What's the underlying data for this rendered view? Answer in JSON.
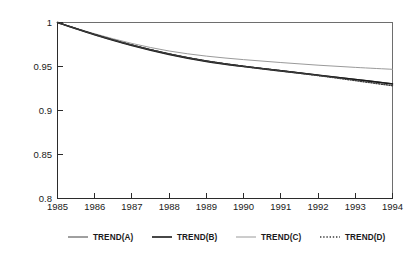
{
  "chart_data": {
    "type": "line",
    "title": "",
    "subtitle": "",
    "xlabel": "",
    "ylabel": "",
    "xlim": [
      1985,
      1994
    ],
    "ylim": [
      0.8,
      1.0
    ],
    "grid": false,
    "legend_position": "bottom",
    "x": [
      1985,
      1986,
      1987,
      1988,
      1989,
      1990,
      1991,
      1992,
      1993,
      1994
    ],
    "xtick_labels": [
      "1985",
      "1986",
      "1987",
      "1988",
      "1989",
      "1990",
      "1991",
      "1992",
      "1993",
      "1994"
    ],
    "ytick_labels": [
      "0.8",
      "0.85",
      "0.9",
      "0.95",
      "1"
    ],
    "ytick_values": [
      0.8,
      0.85,
      0.9,
      0.95,
      1.0
    ],
    "series": [
      {
        "name": "TREND(A)",
        "style": "solid-thin",
        "color": "#2b2b2b",
        "values": [
          1.0,
          0.9865,
          0.9745,
          0.9645,
          0.9565,
          0.9505,
          0.9455,
          0.9405,
          0.9355,
          0.9305
        ]
      },
      {
        "name": "TREND(B)",
        "style": "solid-thick",
        "color": "#1a1a1a",
        "values": [
          1.0,
          0.9862,
          0.974,
          0.9638,
          0.9558,
          0.95,
          0.945,
          0.94,
          0.9352,
          0.9302
        ]
      },
      {
        "name": "TREND(C)",
        "style": "solid-light",
        "color": "#9a9a9a",
        "values": [
          1.0,
          0.9872,
          0.9762,
          0.9676,
          0.9618,
          0.9578,
          0.9545,
          0.9515,
          0.949,
          0.9468
        ]
      },
      {
        "name": "TREND(D)",
        "style": "dotted",
        "color": "#3a3a3a",
        "values": [
          1.0,
          0.9864,
          0.9744,
          0.9643,
          0.9562,
          0.9502,
          0.9451,
          0.9398,
          0.934,
          0.9282
        ]
      }
    ],
    "legend": [
      {
        "label": "TREND(A)",
        "style": "solid-thin",
        "color": "#2b2b2b"
      },
      {
        "label": "TREND(B)",
        "style": "solid-thick",
        "color": "#1a1a1a"
      },
      {
        "label": "TREND(C)",
        "style": "solid-light",
        "color": "#9a9a9a"
      },
      {
        "label": "TREND(D)",
        "style": "dotted",
        "color": "#3a3a3a"
      }
    ]
  }
}
